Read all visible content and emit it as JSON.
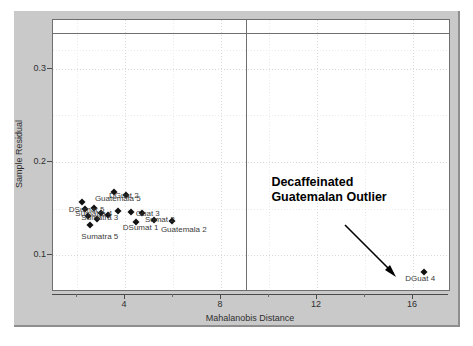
{
  "chart_data": {
    "type": "scatter",
    "title": "",
    "xlabel": "Mahalanobis Distance",
    "ylabel": "Sample Residual",
    "xlim": [
      1.0,
      17.5
    ],
    "ylim": [
      0.063,
      0.352
    ],
    "xticks": [
      4,
      8,
      12,
      16
    ],
    "yticks": [
      0.1,
      0.2,
      0.3
    ],
    "ytick_labels": [
      "0.1",
      "0.2",
      "0.3"
    ],
    "xtick_labels": [
      "4",
      "8",
      "12",
      "16"
    ],
    "grid": true,
    "legend": "none",
    "reference_lines": {
      "horizontal_residual_limit": 0.338,
      "vertical_distance_limit": 9.05
    },
    "points": [
      {
        "label": "Sumatra 5",
        "x": 2.55,
        "y": 0.133
      },
      {
        "label": "DSumat 5",
        "x": 2.2,
        "y": 0.157
      },
      {
        "label": "Guatemala 1",
        "x": 2.35,
        "y": 0.15
      },
      {
        "label": "Sumatra 4",
        "x": 2.45,
        "y": 0.142
      },
      {
        "label": "DGuat 5",
        "x": 2.7,
        "y": 0.151
      },
      {
        "label": "Sumatra 3",
        "x": 2.85,
        "y": 0.139
      },
      {
        "label": "DSumat 3",
        "x": 3.0,
        "y": 0.146
      },
      {
        "label": "Guatemala 5",
        "x": 3.55,
        "y": 0.168
      },
      {
        "label": "DGuat 2",
        "x": 4.05,
        "y": 0.165
      },
      {
        "label": "Sumatra 1",
        "x": 3.3,
        "y": 0.143
      },
      {
        "label": "DSumat 4",
        "x": 3.7,
        "y": 0.148
      },
      {
        "label": "Guatemala 4",
        "x": 4.25,
        "y": 0.147
      },
      {
        "label": "Guat 3",
        "x": 4.7,
        "y": 0.145
      },
      {
        "label": "DSumat 1",
        "x": 4.45,
        "y": 0.136
      },
      {
        "label": "Sumat 2",
        "x": 5.2,
        "y": 0.138
      },
      {
        "label": "Guatemala 2",
        "x": 5.95,
        "y": 0.137
      },
      {
        "label": "DGuat 4",
        "x": 16.45,
        "y": 0.082
      }
    ],
    "visible_point_labels": [
      {
        "text": "Guatemala 5",
        "x": 3.7,
        "y": 0.162
      },
      {
        "text": "DGuat 2",
        "x": 3.95,
        "y": 0.165
      },
      {
        "text": "DSumat 5",
        "x": 2.4,
        "y": 0.15
      },
      {
        "text": "Sumatra 4",
        "x": 2.7,
        "y": 0.146
      },
      {
        "text": "Sumatra 3",
        "x": 2.95,
        "y": 0.141
      },
      {
        "text": "Guat 3",
        "x": 4.95,
        "y": 0.146
      },
      {
        "text": "Sumat 2",
        "x": 5.45,
        "y": 0.139
      },
      {
        "text": "DSumat 1",
        "x": 4.65,
        "y": 0.131
      },
      {
        "text": "Sumatra 5",
        "x": 2.95,
        "y": 0.121
      },
      {
        "text": "Guatemala 2",
        "x": 6.45,
        "y": 0.128
      },
      {
        "text": "DGuat 4",
        "x": 16.3,
        "y": 0.076
      }
    ],
    "annotation": {
      "line1": "Decaffeinated",
      "line2": "Guatemalan Outlier",
      "points_to": "DGuat 4"
    }
  }
}
